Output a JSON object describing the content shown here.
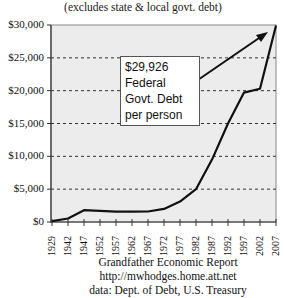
{
  "chart_data": {
    "type": "line",
    "title": "",
    "subtitle": "(excludes state & local govt. debt)",
    "xlabel": "",
    "ylabel": "",
    "ylim": [
      0,
      30000
    ],
    "grid": "horizontal dashed",
    "y_ticks": [
      "$0",
      "$5,000",
      "$10,000",
      "$15,000",
      "$20,000",
      "$25,000",
      "$30,000"
    ],
    "x_ticks": [
      "1929",
      "1942",
      "1947",
      "1952",
      "1957",
      "1962",
      "1967",
      "1972",
      "1977",
      "1982",
      "1987",
      "1992",
      "1997",
      "2002",
      "2007"
    ],
    "series": [
      {
        "name": "Federal Govt. Debt per person",
        "x": [
          "1929",
          "1942",
          "1947",
          "1952",
          "1957",
          "1962",
          "1967",
          "1972",
          "1977",
          "1982",
          "1987",
          "1992",
          "1997",
          "2002",
          "2007"
        ],
        "values": [
          130,
          530,
          1800,
          1700,
          1580,
          1590,
          1600,
          2000,
          3100,
          5000,
          9500,
          15000,
          19700,
          20300,
          29926
        ]
      }
    ],
    "annotation": {
      "text": [
        "$29,926",
        "Federal",
        "Govt. Debt",
        "per person"
      ],
      "arrow_to": "2007"
    }
  },
  "subtitle": "(excludes state & local govt. debt)",
  "callout": {
    "line1": "$29,926",
    "line2": "Federal",
    "line3": "Govt. Debt",
    "line4": "per person"
  },
  "footer": {
    "line1": "Grandfather Economic Report",
    "line2": "http://mwhodges.home.att.net",
    "line3": "data: Dept. of Debt, U.S. Treasury"
  },
  "colors": {
    "plot_bg": "#ececec",
    "line": "#111111",
    "grid": "#333333"
  }
}
